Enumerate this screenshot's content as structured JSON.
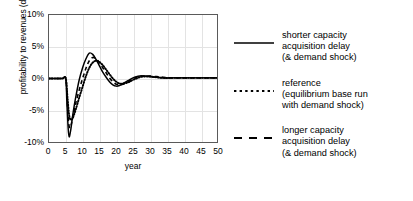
{
  "chart_data": {
    "type": "line",
    "title": "",
    "xlabel": "year",
    "ylabel": "profitability to revenues (dmnl)",
    "xlim": [
      0,
      50
    ],
    "ylim": [
      -0.1,
      0.1
    ],
    "grid": true,
    "legend_position": "right",
    "ytick_labels": [
      "10%",
      "5%",
      "0%",
      "-5%",
      "-10%"
    ],
    "ytick_values": [
      0.1,
      0.05,
      0.0,
      -0.05,
      -0.1
    ],
    "xtick_labels": [
      "0",
      "5",
      "10",
      "15",
      "20",
      "25",
      "30",
      "35",
      "40",
      "45",
      "50"
    ],
    "xtick_values": [
      0,
      5,
      10,
      15,
      20,
      25,
      30,
      35,
      40,
      45,
      50
    ],
    "series": [
      {
        "name": "shorter capacity acquisition delay (& demand shock)",
        "style": "solid",
        "color": "#000000",
        "x": [
          0,
          1,
          2,
          3,
          4,
          5,
          5.3,
          5.7,
          6,
          6.5,
          7,
          7.5,
          8,
          9,
          10,
          11,
          12,
          13,
          14,
          15,
          16,
          17,
          18,
          19,
          20,
          21,
          22,
          23,
          24,
          25,
          26,
          27,
          28,
          29,
          30,
          32,
          34,
          36,
          38,
          40,
          42,
          45,
          48,
          50
        ],
        "y": [
          0.0,
          0.0,
          0.0,
          0.0,
          0.0,
          0.0,
          -0.035,
          -0.078,
          -0.092,
          -0.08,
          -0.06,
          -0.043,
          -0.028,
          -0.002,
          0.017,
          0.031,
          0.04,
          0.038,
          0.03,
          0.02,
          0.01,
          0.002,
          -0.005,
          -0.01,
          -0.012,
          -0.011,
          -0.008,
          -0.005,
          -0.002,
          0.001,
          0.003,
          0.004,
          0.004,
          0.004,
          0.003,
          0.002,
          0.001,
          0.001,
          0.001,
          0.001,
          0.001,
          0.001,
          0.001,
          0.001
        ]
      },
      {
        "name": "reference (equilibrium base run with demand shock)",
        "style": "dotted",
        "color": "#000000",
        "x": [
          0,
          1,
          2,
          3,
          4,
          5,
          5.5,
          6,
          6.5,
          7,
          7.5,
          8,
          9,
          10,
          11,
          12,
          13,
          14,
          15,
          16,
          17,
          18,
          19,
          20,
          21,
          22,
          23,
          24,
          25,
          26,
          27,
          28,
          29,
          30,
          32,
          34,
          36,
          38,
          40,
          42,
          45,
          48,
          50
        ],
        "y": [
          0.0,
          0.0,
          0.0,
          0.0,
          0.0,
          0.0,
          -0.03,
          -0.058,
          -0.065,
          -0.063,
          -0.056,
          -0.048,
          -0.03,
          -0.013,
          0.004,
          0.017,
          0.025,
          0.028,
          0.026,
          0.021,
          0.014,
          0.007,
          0.0,
          -0.005,
          -0.008,
          -0.008,
          -0.007,
          -0.005,
          -0.002,
          0.0,
          0.002,
          0.003,
          0.003,
          0.003,
          0.002,
          0.001,
          0.001,
          0.001,
          0.001,
          0.001,
          0.001,
          0.001,
          0.001
        ]
      },
      {
        "name": "longer capacity acquisition delay (& demand shock)",
        "style": "dashed",
        "color": "#000000",
        "x": [
          0,
          1,
          2,
          3,
          4,
          5,
          5.4,
          5.8,
          6.2,
          6.6,
          7,
          7.5,
          8,
          9,
          10,
          11,
          12,
          13,
          14,
          15,
          16,
          17,
          18,
          19,
          20,
          21,
          22,
          23,
          24,
          25,
          26,
          27,
          28,
          29,
          30,
          32,
          34,
          36,
          38,
          40,
          42,
          45,
          48,
          50
        ],
        "y": [
          0.0,
          0.0,
          0.0,
          0.0,
          0.0,
          0.0,
          -0.033,
          -0.068,
          -0.078,
          -0.073,
          -0.062,
          -0.05,
          -0.038,
          -0.018,
          0.0,
          0.016,
          0.028,
          0.033,
          0.031,
          0.025,
          0.017,
          0.009,
          0.001,
          -0.005,
          -0.009,
          -0.01,
          -0.009,
          -0.006,
          -0.003,
          0.0,
          0.002,
          0.004,
          0.004,
          0.004,
          0.004,
          0.003,
          0.002,
          0.001,
          0.001,
          0.001,
          0.001,
          0.001,
          0.001,
          0.001
        ]
      }
    ],
    "legend_entries": [
      {
        "style": "solid",
        "lines": [
          "shorter capacity",
          "acquisition delay",
          "(& demand shock)"
        ]
      },
      {
        "style": "dotted",
        "lines": [
          "reference",
          "(equilibrium base run",
          "with demand shock)"
        ]
      },
      {
        "style": "dashed",
        "lines": [
          "longer capacity",
          "acquisition delay",
          "(& demand shock)"
        ]
      }
    ]
  }
}
